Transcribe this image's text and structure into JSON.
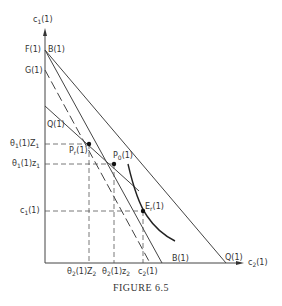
{
  "figure": {
    "caption": "FIGURE 6.5",
    "y_axis_label": "c1(1)",
    "x_axis_label": "c2(1)",
    "y_axis_ticks": [
      {
        "label": "F(1)",
        "y": 50
      },
      {
        "label": "B(1)",
        "y": 50
      },
      {
        "label": "G(1)",
        "y": 70
      },
      {
        "label": "Q(1)",
        "y": 106
      },
      {
        "label": "θ1(1)Z1",
        "y": 144
      },
      {
        "label": "θ1(1)z1",
        "y": 164
      },
      {
        "label": "c1(1)",
        "y": 211
      }
    ],
    "x_axis_ticks": [
      {
        "label": "θ2(1)Z2",
        "x": 89
      },
      {
        "label": "θ2(1)z2",
        "x": 114
      },
      {
        "label": "c2(1)",
        "x": 143
      },
      {
        "label": "B(1)",
        "x": 162
      },
      {
        "label": "Q(1)",
        "x": 226
      }
    ],
    "points": [
      {
        "label": "Pr(1)",
        "x": 89,
        "y": 144
      },
      {
        "label": "P0(1)",
        "x": 114,
        "y": 164
      },
      {
        "label": "Er(1)",
        "x": 143,
        "y": 211
      }
    ],
    "labels": {
      "y_axis_c": "c",
      "y_axis_sub": "1",
      "y_axis_suffix": "(1)",
      "x_axis_c": "c",
      "x_axis_sub": "2",
      "x_axis_suffix": "(1)",
      "F": "F(1)",
      "B_top": "B(1)",
      "G": "G(1)",
      "Q_left": "Q(1)",
      "theta1Z1_pre": "θ",
      "theta1Z1_sub1": "1",
      "theta1Z1_mid": "(1)Z",
      "theta1Z1_sub2": "1",
      "theta1z1_pre": "θ",
      "theta1z1_sub1": "1",
      "theta1z1_mid": "(1)z",
      "theta1z1_sub2": "1",
      "c1_pre": "c",
      "c1_sub": "1",
      "c1_suf": "(1)",
      "theta2Z2_pre": "θ",
      "theta2Z2_sub1": "2",
      "theta2Z2_mid": "(1)Z",
      "theta2Z2_sub2": "2",
      "theta2z2_pre": "θ",
      "theta2z2_sub1": "2",
      "theta2z2_mid": "(1)z",
      "theta2z2_sub2": "2",
      "c2_pre": "c",
      "c2_sub": "2",
      "c2_suf": "(1)",
      "B_bottom": "B(1)",
      "Q_bottom": "Q(1)",
      "Pr_pre": "P",
      "Pr_sub": "r",
      "Pr_suf": "(1)",
      "P0_pre": "P",
      "P0_sub": "0",
      "P0_suf": "(1)",
      "Er_pre": "E",
      "Er_sub": "r",
      "Er_suf": "(1)"
    }
  }
}
